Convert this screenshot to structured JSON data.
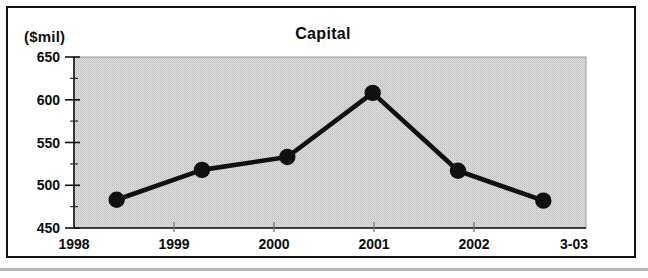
{
  "figure": {
    "unit_label": "($mil)",
    "title": "Capital"
  },
  "chart_data": {
    "type": "line",
    "title": "Capital",
    "subtitle": "",
    "xlabel": "",
    "ylabel": "($mil)",
    "unit_label": "($mil)",
    "categories": [
      "1998",
      "1999",
      "2000",
      "2001",
      "2002",
      "3-03"
    ],
    "values": [
      483,
      518,
      533,
      608,
      517,
      482
    ],
    "series": [
      {
        "name": "Capital",
        "values": [
          483,
          518,
          533,
          608,
          517,
          482
        ]
      }
    ],
    "ylim": [
      450,
      650
    ],
    "ytick_labels": [
      "650",
      "600",
      "550",
      "500",
      "450"
    ],
    "ytick_values": [
      650,
      600,
      550,
      500,
      450
    ],
    "y_minor_tick_values": [
      625,
      575,
      525,
      475
    ],
    "y_major_interval": 50,
    "y_minor_interval": 25,
    "xtick_labels": [
      "1998",
      "1999",
      "2000",
      "2001",
      "2002",
      "3-03"
    ],
    "grid": false,
    "legend": "none",
    "marker": "filled-circle",
    "line_color": "#101010",
    "marker_color": "#101010",
    "plot_background": "#d4d4d4",
    "frame_color": "#111111",
    "annotations": []
  },
  "axis": {
    "y_labels": [
      "650",
      "600",
      "550",
      "500",
      "450"
    ],
    "x_labels": [
      "1998",
      "1999",
      "2000",
      "2001",
      "2002",
      "3-03"
    ]
  }
}
